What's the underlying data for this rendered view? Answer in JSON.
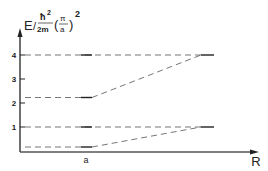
{
  "diagram": {
    "y_axis_label": {
      "E": "E",
      "slash": "/",
      "hbar": "ħ",
      "exp2": "2",
      "two_m": "2m",
      "lparen": "(",
      "pi": "π",
      "a": "a",
      "rparen": ")",
      "outer_exp": "2"
    },
    "x_axis_label": "R",
    "x_tick_label": "a",
    "y_ticks": [
      "1",
      "2",
      "3",
      "4"
    ],
    "levels_left": [
      {
        "name": "level-0.25",
        "value": 0.25
      },
      {
        "name": "level-1",
        "value": 1
      },
      {
        "name": "level-2.25",
        "value": 2.25
      },
      {
        "name": "level-4",
        "value": 4
      }
    ],
    "levels_right": [
      {
        "name": "level-1",
        "value": 1
      },
      {
        "name": "level-4",
        "value": 4
      }
    ],
    "colors": {
      "line": "#222222",
      "dash": "#555555"
    }
  }
}
